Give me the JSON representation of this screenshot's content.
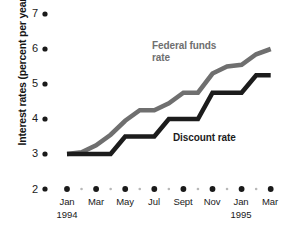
{
  "chart_data": {
    "type": "line",
    "title": "",
    "subtitle": "",
    "xlabel": "",
    "ylabel": "Interest rates (percent per year)",
    "ylim": [
      2,
      7
    ],
    "ytick_values": [
      7,
      6,
      5,
      4,
      3,
      2
    ],
    "ytick_labels": [
      "7",
      "6",
      "5",
      "4",
      "3",
      "2"
    ],
    "grid": false,
    "legend_position": "inline-annotation",
    "x_major_labels": [
      "Jan",
      "Mar",
      "May",
      "Jul",
      "Sept",
      "Nov",
      "Jan",
      "Mar"
    ],
    "x_year_labels": [
      {
        "label": "1994",
        "at": "Jan"
      },
      {
        "label": "1995",
        "at": "Jan"
      }
    ],
    "x": [
      "Jan 1994",
      "Feb 1994",
      "Mar 1994",
      "Apr 1994",
      "May 1994",
      "Jun 1994",
      "Jul 1994",
      "Aug 1994",
      "Sept 1994",
      "Oct 1994",
      "Nov 1994",
      "Dec 1994",
      "Jan 1995",
      "Feb 1995",
      "Mar 1995"
    ],
    "series": [
      {
        "name": "Federal funds rate",
        "color": "#6f6f6f",
        "values": [
          3.0,
          3.05,
          3.25,
          3.55,
          3.95,
          4.25,
          4.25,
          4.45,
          4.75,
          4.75,
          5.3,
          5.5,
          5.55,
          5.85,
          6.0
        ]
      },
      {
        "name": "Discount rate",
        "color": "#1c1c1c",
        "values": [
          3.0,
          3.0,
          3.0,
          3.0,
          3.5,
          3.5,
          3.5,
          4.0,
          4.0,
          4.0,
          4.75,
          4.75,
          4.75,
          5.25,
          5.25
        ]
      }
    ],
    "annotations": [
      {
        "text": "Federal funds\nrate",
        "series": "Federal funds rate",
        "color": "#6f6f6f"
      },
      {
        "text": "Discount rate",
        "series": "Discount rate",
        "color": "#1c1c1c"
      }
    ],
    "axis_marker_style": "dots",
    "major_dot_color": "#1a1a1a",
    "minor_dot_color": "#b8b8b8"
  },
  "axis": {
    "y_title": "Interest rates (percent per year)",
    "y_ticks": [
      "7",
      "6",
      "5",
      "4",
      "3",
      "2"
    ],
    "x_ticks": [
      {
        "label": "Jan",
        "year": "1994"
      },
      {
        "label": "Mar",
        "year": ""
      },
      {
        "label": "May",
        "year": ""
      },
      {
        "label": "Jul",
        "year": ""
      },
      {
        "label": "Sept",
        "year": ""
      },
      {
        "label": "Nov",
        "year": ""
      },
      {
        "label": "Jan",
        "year": "1995"
      },
      {
        "label": "Mar",
        "year": ""
      }
    ]
  },
  "labels": {
    "federal_funds_line1": "Federal funds",
    "federal_funds_line2": "rate",
    "discount": "Discount rate"
  },
  "colors": {
    "federal_funds": "#6f6f6f",
    "discount": "#1c1c1c",
    "text": "#1a1a1a",
    "minor_dot": "#b8b8b8",
    "background": "#ffffff"
  }
}
